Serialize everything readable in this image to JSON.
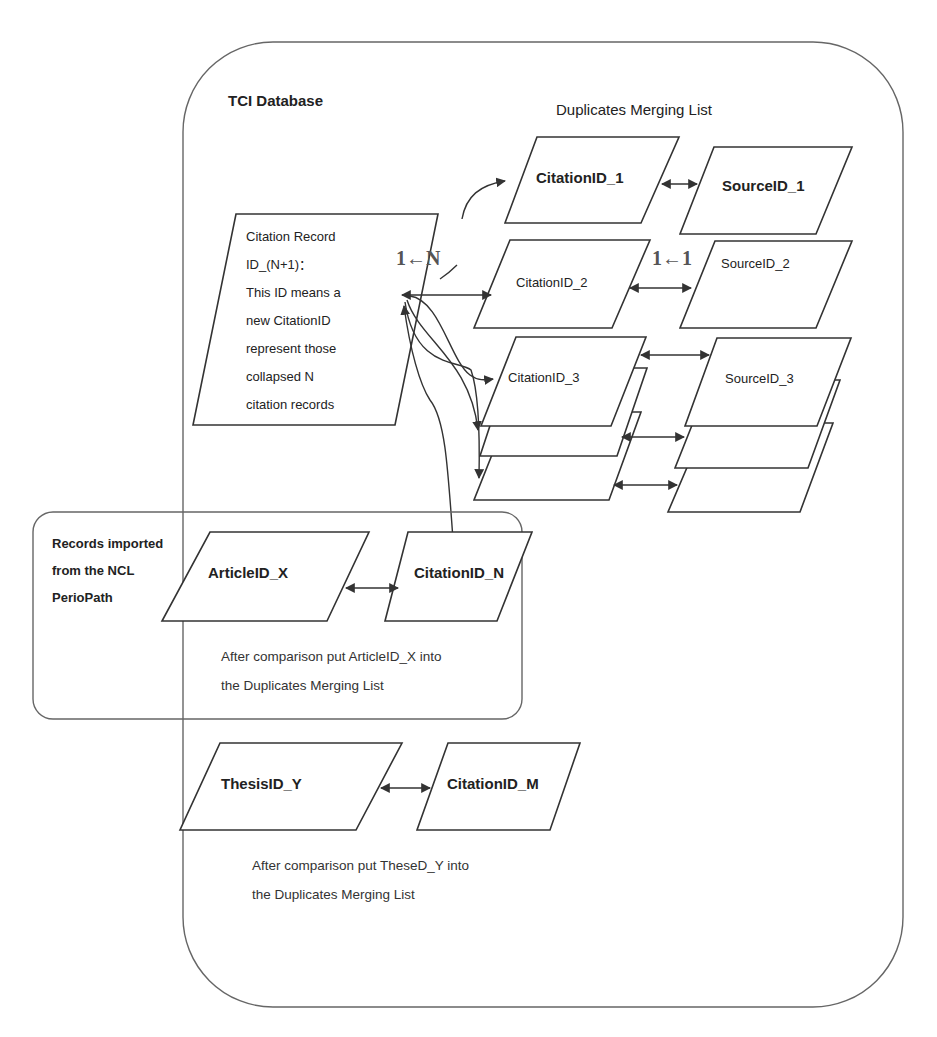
{
  "tci_database": {
    "title": "TCI Database"
  },
  "duplicates_list": {
    "title": "Duplicates Merging List",
    "relation_label": "1←1",
    "citations": [
      {
        "label": "CitationID_1",
        "bold": true
      },
      {
        "label": "CitationID_2",
        "bold": false
      },
      {
        "label": "CitationID_3",
        "bold": false
      }
    ],
    "sources": [
      {
        "label": "SourceID_1",
        "bold": true
      },
      {
        "label": "SourceID_2",
        "bold": false
      },
      {
        "label": "SourceID_3",
        "bold": false
      }
    ]
  },
  "citation_record": {
    "lines": [
      "Citation Record",
      "ID_(N+1)：",
      "This ID means a",
      "new CitationID",
      "represent those",
      "collapsed N",
      "citation records"
    ],
    "relation_label": "1←N"
  },
  "ncl_section": {
    "title_lines": [
      "Records imported",
      "from the NCL",
      "PerioPath"
    ],
    "article": "ArticleID_X",
    "citation": "CitationID_N",
    "note_lines": [
      "After comparison put ArticleID_X into",
      "the Duplicates Merging List"
    ]
  },
  "thesis_section": {
    "thesis": "ThesisID_Y",
    "citation": "CitationID_M",
    "note_lines": [
      "After comparison put TheseD_Y into",
      "the Duplicates Merging List"
    ]
  },
  "colors": {
    "stroke": "#333333",
    "container_stroke": "#666666",
    "text": "#222222",
    "background": "#ffffff"
  }
}
